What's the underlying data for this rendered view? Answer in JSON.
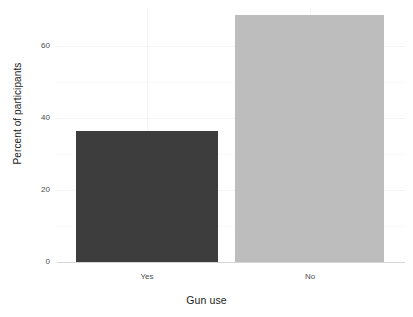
{
  "chart_data": {
    "type": "bar",
    "title": "",
    "subtitle": "",
    "xlabel": "Gun use",
    "ylabel": "Percent of participants",
    "categories": [
      "Yes",
      "No"
    ],
    "values": [
      35,
      66
    ],
    "series": [
      {
        "name": "Percent of participants",
        "values": [
          35,
          66
        ]
      }
    ],
    "ylim": [
      0,
      68
    ],
    "y_ticks": [
      0,
      20,
      40,
      60
    ],
    "y_tick_labels": [
      "0",
      "20",
      "40",
      "60"
    ],
    "x_tick_labels": [
      "Yes",
      "No"
    ],
    "bar_colors": [
      "#3d3d3d",
      "#bdbdbd"
    ],
    "grid": {
      "horizontal": true,
      "vertical": true,
      "color": "#f5f5f5"
    },
    "legend": {
      "visible": false,
      "position": "none"
    },
    "background_color": "#ffffff",
    "axis_text_color": "#4d4d4d",
    "axis_title_color": "#1a1a1a"
  }
}
